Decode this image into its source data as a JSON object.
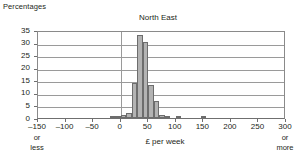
{
  "labels": {
    "y_axis_caption": "Percentages",
    "x_axis_title": "£ per week",
    "left_end_note_1": "or",
    "left_end_note_2": "less",
    "right_end_note_1": "or",
    "right_end_note_2": "more"
  },
  "colors": {
    "bar_fill": "#b3b3b3",
    "bar_stroke": "#6d6d6d",
    "gridline": "#9a9a9a",
    "axis": "#6f6f6f",
    "text": "#231f20",
    "background": "#ffffff"
  },
  "chart_data": {
    "type": "bar",
    "title": "North East",
    "subtitle": "",
    "xlabel": "£ per week",
    "ylabel": "Percentages",
    "xlim": [
      -150,
      300
    ],
    "ylim": [
      0,
      35
    ],
    "grid": true,
    "legend": false,
    "xticks": [
      -150,
      -100,
      -50,
      0,
      50,
      100,
      150,
      200,
      250,
      300
    ],
    "xtick_labels": [
      "–150",
      "–100",
      "–50",
      "0",
      "50",
      "100",
      "150",
      "200",
      "250",
      "300"
    ],
    "yticks": [
      0,
      5,
      10,
      15,
      20,
      25,
      30,
      35
    ],
    "ytick_labels": [
      "0",
      "5",
      "10",
      "15",
      "20",
      "25",
      "30",
      "35"
    ],
    "bin_width": 10,
    "bins": [
      {
        "x_start": -20,
        "x_end": -10,
        "center": -15,
        "value": 0.5
      },
      {
        "x_start": -10,
        "x_end": 0,
        "center": -5,
        "value": 0.9
      },
      {
        "x_start": 0,
        "x_end": 10,
        "center": 5,
        "value": 1.1
      },
      {
        "x_start": 10,
        "x_end": 20,
        "center": 15,
        "value": 2.0
      },
      {
        "x_start": 20,
        "x_end": 30,
        "center": 25,
        "value": 14.0
      },
      {
        "x_start": 30,
        "x_end": 40,
        "center": 35,
        "value": 33.0
      },
      {
        "x_start": 40,
        "x_end": 50,
        "center": 45,
        "value": 30.2
      },
      {
        "x_start": 50,
        "x_end": 60,
        "center": 55,
        "value": 13.1
      },
      {
        "x_start": 60,
        "x_end": 70,
        "center": 65,
        "value": 6.8
      },
      {
        "x_start": 70,
        "x_end": 80,
        "center": 75,
        "value": 1.3
      },
      {
        "x_start": 80,
        "x_end": 90,
        "center": 85,
        "value": 0.5
      },
      {
        "x_start": 100,
        "x_end": 110,
        "center": 105,
        "value": 0.6
      },
      {
        "x_start": 145,
        "x_end": 155,
        "center": 150,
        "value": 0.25
      }
    ],
    "annotations": [
      {
        "text": "or less",
        "at_x": -150
      },
      {
        "text": "or more",
        "at_x": 300
      }
    ]
  }
}
